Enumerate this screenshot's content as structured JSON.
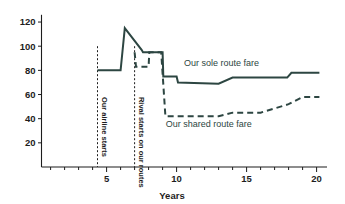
{
  "chart_data": {
    "type": "line",
    "title": "",
    "xlabel": "Years",
    "ylabel": "",
    "xlim": [
      0,
      20.6
    ],
    "ylim": [
      0,
      126
    ],
    "grid": false,
    "legend_position": "inline-annotation",
    "x_ticks_major": [
      5,
      10,
      15,
      20
    ],
    "x_tick_labels": [
      "5",
      "10",
      "15",
      "20"
    ],
    "x_ticks_minor": [
      1,
      2,
      3,
      4,
      6,
      7,
      8,
      9,
      11,
      12,
      13,
      14,
      16,
      17,
      18,
      19
    ],
    "y_ticks": [
      20,
      40,
      60,
      80,
      100,
      120
    ],
    "y_tick_labels": [
      "20",
      "40",
      "60",
      "80",
      "100",
      "120"
    ],
    "series": [
      {
        "name": "Our sole route fare",
        "style": "solid",
        "color": "#2d4642",
        "points": [
          [
            4.35,
            80
          ],
          [
            6.0,
            80
          ],
          [
            6.3,
            115
          ],
          [
            7.5,
            97
          ],
          [
            7.6,
            95
          ],
          [
            9.0,
            95
          ],
          [
            9.05,
            75
          ],
          [
            10.0,
            75
          ],
          [
            10.1,
            70
          ],
          [
            13.0,
            69
          ],
          [
            14.0,
            74
          ],
          [
            17.9,
            74
          ],
          [
            18.2,
            78
          ],
          [
            20.2,
            78
          ]
        ]
      },
      {
        "name": "Our shared route fare",
        "style": "dashed",
        "color": "#2d4642",
        "points": [
          [
            7.0,
            95
          ],
          [
            7.1,
            83
          ],
          [
            8.0,
            83
          ],
          [
            8.05,
            95
          ],
          [
            8.9,
            95
          ],
          [
            9.2,
            42
          ],
          [
            13.0,
            42
          ],
          [
            14.0,
            45
          ],
          [
            16.0,
            45
          ],
          [
            18.0,
            52
          ],
          [
            19.0,
            58
          ],
          [
            20.2,
            58
          ]
        ]
      }
    ],
    "annotations": [
      {
        "name": "our-airline-starts",
        "text": "Our airline starts",
        "x": 4.35,
        "orientation": "vertical",
        "marker": "dashed-vertical-line",
        "marker_y_top": 100,
        "marker_y_bottom": 0
      },
      {
        "name": "rival-starts-on-our-routes",
        "text": "Rival starts on our routes",
        "x": 7.0,
        "orientation": "vertical",
        "marker": "dashed-vertical-line",
        "marker_y_top": 100,
        "marker_y_bottom": 0
      }
    ],
    "series_labels": [
      {
        "name": "Our sole route fare",
        "text": "Our sole route fare",
        "x": 13.2,
        "y": 84
      },
      {
        "name": "Our shared route fare",
        "text": "Our shared route fare",
        "x": 12.3,
        "y": 33
      }
    ]
  },
  "colors": {
    "series": "#2d4642",
    "axis": "#1d1d1d",
    "background": "#ffffff"
  }
}
